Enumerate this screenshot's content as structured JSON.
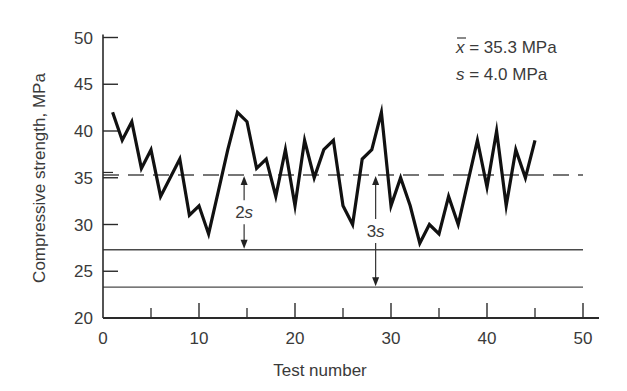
{
  "chart_data": {
    "type": "line",
    "title": "",
    "xlabel": "Test number",
    "ylabel": "Compressive strength, MPa",
    "xlim": [
      0,
      50
    ],
    "ylim": [
      20,
      50
    ],
    "x_ticks": [
      0,
      10,
      20,
      30,
      40,
      50
    ],
    "x_ticks_minor": [
      5,
      15,
      25,
      35,
      45
    ],
    "y_ticks": [
      20,
      25,
      30,
      35,
      40,
      45,
      50
    ],
    "grid": false,
    "x": [
      1,
      2,
      3,
      4,
      5,
      6,
      7,
      8,
      9,
      10,
      11,
      12,
      13,
      14,
      15,
      16,
      17,
      18,
      19,
      20,
      21,
      22,
      23,
      24,
      25,
      26,
      27,
      28,
      29,
      30,
      31,
      32,
      33,
      34,
      35,
      36,
      37,
      38,
      39,
      40,
      41,
      42,
      43,
      44,
      45
    ],
    "series": [
      {
        "name": "Compressive strength",
        "values": [
          42,
          39,
          41,
          36,
          38,
          33,
          35,
          37,
          31,
          32,
          29,
          33.5,
          38,
          42,
          41,
          36,
          37,
          33,
          38,
          32,
          39,
          35,
          38,
          39,
          32,
          30,
          37,
          38,
          42,
          32,
          35,
          32,
          28,
          30,
          29,
          33,
          30,
          34.5,
          39,
          34,
          40,
          32,
          38,
          35,
          39
        ]
      }
    ],
    "reference_lines": [
      {
        "name": "mean",
        "value": 35.3,
        "style": "dashed"
      },
      {
        "name": "mean-2s",
        "value": 27.3,
        "style": "solid"
      },
      {
        "name": "mean-3s",
        "value": 23.3,
        "style": "solid"
      }
    ],
    "annotations": [
      {
        "text": "2s",
        "x": 14.7,
        "from": 35.3,
        "to": 27.3
      },
      {
        "text": "3s",
        "x": 28.4,
        "from": 35.3,
        "to": 23.3
      }
    ],
    "legend": {
      "position": "top-right",
      "mean_label": "x̄ = 35.3 MPa",
      "sd_label": "s = 4.0 MPa"
    }
  },
  "labels": {
    "xlabel": "Test number",
    "ylabel": "Compressive strength, MPa",
    "mean_symbol": "x",
    "mean_text": " = 35.3 MPa",
    "sd_symbol": "s",
    "sd_text": " = 4.0 MPa",
    "annot_2s_num": "2",
    "annot_2s_sym": "s",
    "annot_3s_num": "3",
    "annot_3s_sym": "s"
  },
  "colors": {
    "line": "#111111",
    "axis": "#2a2a2a",
    "text": "#3a3a3a",
    "reference": "#4a4a4a"
  }
}
